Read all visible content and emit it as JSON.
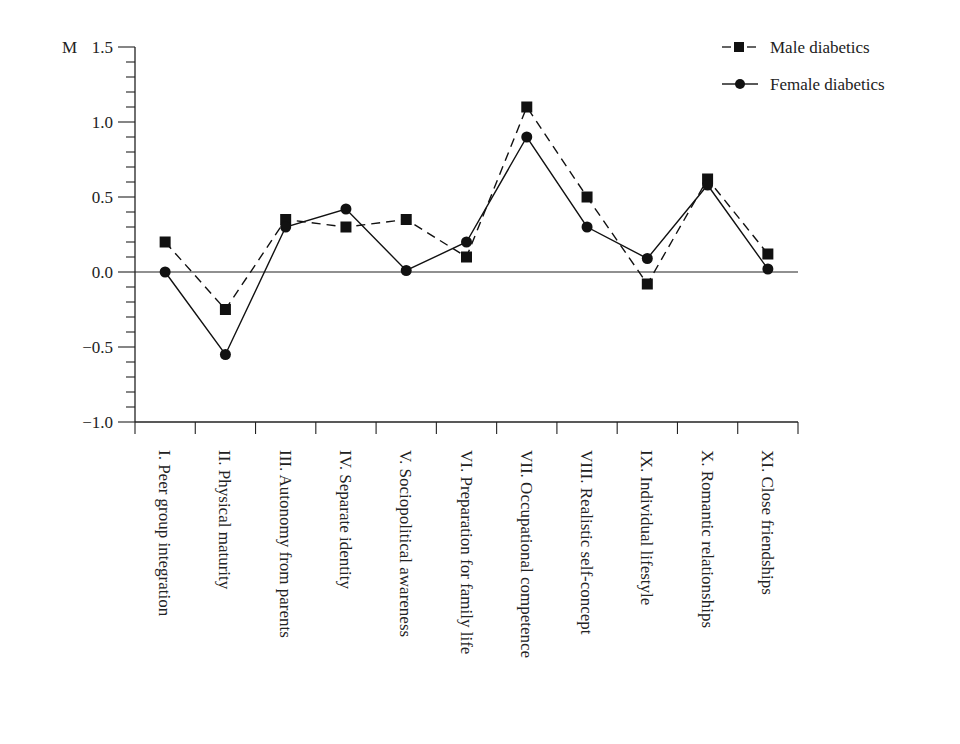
{
  "chart_data": {
    "type": "line",
    "title": "",
    "ylabel": "M",
    "xlabel": "",
    "ylim": [
      -1.0,
      1.5
    ],
    "yticks": [
      "-1.0",
      "-0.5",
      "0.0",
      "0.5",
      "1.0",
      "1.5"
    ],
    "ytick_values": [
      -1.0,
      -0.5,
      0.0,
      0.5,
      1.0,
      1.5
    ],
    "y_minor_step": 0.1,
    "grid": false,
    "legend_position": "top-right",
    "categories": [
      "I. Peer group integration",
      "II. Physical maturity",
      "III. Autonomy from parents",
      "IV. Separate identity",
      "V. Sociopolitical awareness",
      "VI. Preparation for family life",
      "VII. Occupational competence",
      "VIII. Realistic self-concept",
      "IX. Individual lifestyle",
      "X. Romantic relationships",
      "XI. Close friendships"
    ],
    "series": [
      {
        "name": "Male diabetics",
        "marker": "square",
        "line_style": "dashed",
        "color": "#111111",
        "values": [
          0.2,
          -0.25,
          0.35,
          0.3,
          0.35,
          0.1,
          1.1,
          0.5,
          -0.08,
          0.62,
          0.12
        ]
      },
      {
        "name": "Female diabetics",
        "marker": "circle",
        "line_style": "solid",
        "color": "#111111",
        "values": [
          0.0,
          -0.55,
          0.3,
          0.42,
          0.01,
          0.2,
          0.9,
          0.3,
          0.09,
          0.58,
          0.02
        ]
      }
    ]
  },
  "legend": {
    "items": [
      {
        "label": "Male diabetics"
      },
      {
        "label": "Female diabetics"
      }
    ]
  },
  "axis": {
    "y_title": "M"
  }
}
